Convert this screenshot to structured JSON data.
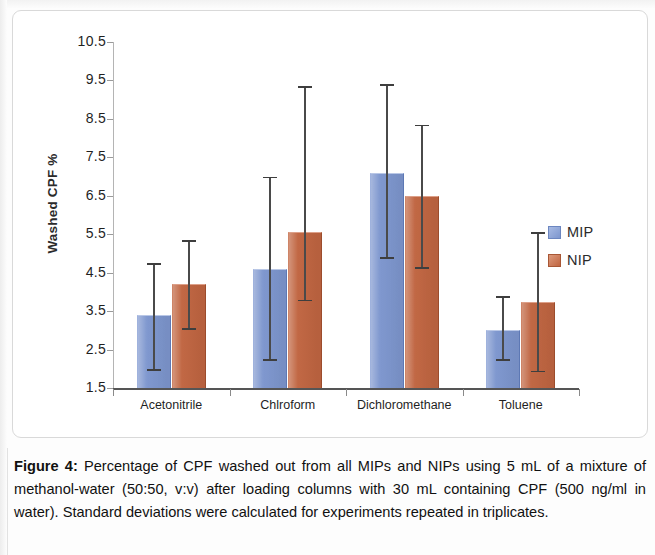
{
  "figure": {
    "caption_label": "Figure 4:",
    "caption_body": " Percentage of CPF washed out from all MIPs and NIPs using 5 mL of a mixture of methanol-water (50:50, v:v) after loading columns with 30 mL containing  CPF (500 ng/ml in water). Standard deviations were calculated for experiments repeated in triplicates."
  },
  "chart_data": {
    "type": "bar",
    "title": "",
    "xlabel": "",
    "ylabel": "Washed CPF %",
    "categories": [
      "Acetonitrile",
      "Chlroform",
      "Dichloromethane",
      "Toluene"
    ],
    "ylim": [
      1.5,
      10.5
    ],
    "yticks": [
      "1.5",
      "2.5",
      "3.5",
      "4.5",
      "5.5",
      "6.5",
      "7.5",
      "8.5",
      "9.5",
      "10.5"
    ],
    "ytick_values": [
      1.5,
      2.5,
      3.5,
      4.5,
      5.5,
      6.5,
      7.5,
      8.5,
      9.5,
      10.5
    ],
    "grid": false,
    "legend_position": "right",
    "series": [
      {
        "name": "MIP",
        "color": "#7d96ce",
        "values": [
          3.4,
          4.6,
          7.1,
          3.0
        ],
        "error_low": [
          1.4,
          2.35,
          2.2,
          0.75
        ],
        "error_high": [
          1.35,
          2.4,
          2.3,
          0.9
        ]
      },
      {
        "name": "NIP",
        "color": "#c06541",
        "values": [
          4.2,
          5.55,
          6.5,
          3.75
        ],
        "error_low": [
          1.15,
          1.75,
          1.85,
          1.8
        ],
        "error_high": [
          1.15,
          3.8,
          1.85,
          1.8
        ]
      }
    ]
  },
  "legend": {
    "items": [
      {
        "label": "MIP",
        "color": "#7d96ce"
      },
      {
        "label": "NIP",
        "color": "#c06541"
      }
    ]
  }
}
